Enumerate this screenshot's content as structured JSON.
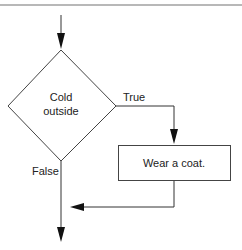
{
  "diagram": {
    "type": "flowchart",
    "decision": {
      "label_line1": "Cold",
      "label_line2": "outside"
    },
    "branches": {
      "true_label": "True",
      "false_label": "False"
    },
    "action": {
      "label": "Wear a coat."
    },
    "colors": {
      "stroke": "#333333",
      "rule": "#b8b8b8"
    }
  }
}
